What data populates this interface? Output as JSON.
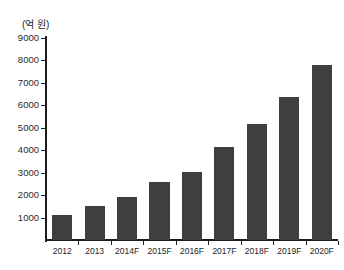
{
  "chart_data": {
    "type": "bar",
    "title": "",
    "subtitle": "",
    "unit_label": "(억 원)",
    "xlabel": "",
    "ylabel": "",
    "categories": [
      "2012",
      "2013",
      "2014F",
      "2015F",
      "2016F",
      "2017F",
      "2018F",
      "2019F",
      "2020F"
    ],
    "values": [
      1100,
      1500,
      1900,
      2600,
      3050,
      4150,
      5150,
      6350,
      7800
    ],
    "series": [
      {
        "name": "",
        "values": [
          1100,
          1500,
          1900,
          2600,
          3050,
          4150,
          5150,
          6350,
          7800
        ]
      }
    ],
    "ylim": [
      0,
      9000
    ],
    "ytick_labels": [
      "9000",
      "8000",
      "7000",
      "6000",
      "5000",
      "4000",
      "3000",
      "2000",
      "1000"
    ],
    "ytick_values": [
      9000,
      8000,
      7000,
      6000,
      5000,
      4000,
      3000,
      2000,
      1000
    ],
    "ytick_step": 1000,
    "grid": false,
    "legend": "none",
    "bar_color": "#3f3f3f",
    "axis_color": "#1c1c1c",
    "background_color": "#ffffff"
  }
}
